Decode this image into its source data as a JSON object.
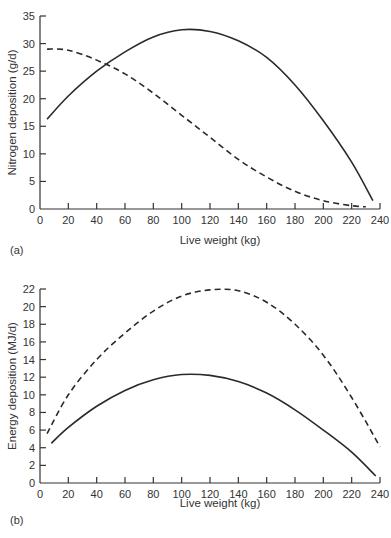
{
  "chart_data": [
    {
      "type": "line",
      "panel_label": "(a)",
      "title": "",
      "xlabel": "Live weight (kg)",
      "ylabel": "Nitrogen deposition (g/d)",
      "xlim": [
        0,
        240
      ],
      "ylim": [
        0,
        35
      ],
      "xticks": [
        0,
        20,
        40,
        60,
        80,
        100,
        120,
        140,
        160,
        180,
        200,
        220,
        240
      ],
      "yticks": [
        0,
        5,
        10,
        15,
        20,
        25,
        30,
        35
      ],
      "grid": false,
      "legend": null,
      "series": [
        {
          "name": "solid",
          "style": "solid",
          "x": [
            5,
            20,
            40,
            60,
            80,
            100,
            120,
            140,
            160,
            180,
            200,
            220,
            235
          ],
          "y": [
            16.3,
            20.5,
            25.0,
            28.5,
            31.2,
            32.5,
            32.2,
            30.5,
            27.5,
            22.5,
            16.0,
            8.5,
            1.5
          ]
        },
        {
          "name": "dashed",
          "style": "dashed",
          "x": [
            5,
            20,
            40,
            60,
            80,
            100,
            120,
            140,
            160,
            180,
            200,
            220,
            230
          ],
          "y": [
            29.0,
            28.8,
            27.0,
            24.5,
            21.0,
            17.0,
            13.0,
            9.0,
            5.8,
            3.2,
            1.5,
            0.6,
            0.4
          ]
        }
      ]
    },
    {
      "type": "line",
      "panel_label": "(b)",
      "title": "",
      "xlabel": "Live weight (kg)",
      "ylabel": "Energy deposition (MJ/d)",
      "xlim": [
        0,
        240
      ],
      "ylim": [
        0,
        22
      ],
      "xticks": [
        0,
        20,
        40,
        60,
        80,
        100,
        120,
        140,
        160,
        180,
        200,
        220,
        240
      ],
      "yticks": [
        0,
        2,
        4,
        6,
        8,
        10,
        12,
        14,
        16,
        18,
        20,
        22
      ],
      "grid": false,
      "legend": null,
      "series": [
        {
          "name": "solid",
          "style": "solid",
          "x": [
            8,
            20,
            40,
            60,
            80,
            100,
            120,
            140,
            160,
            180,
            200,
            220,
            237
          ],
          "y": [
            4.5,
            6.3,
            8.7,
            10.5,
            11.7,
            12.3,
            12.2,
            11.5,
            10.2,
            8.3,
            6.0,
            3.5,
            0.8
          ]
        },
        {
          "name": "dashed",
          "style": "dashed",
          "x": [
            5,
            20,
            40,
            60,
            80,
            100,
            120,
            140,
            160,
            180,
            200,
            220,
            240
          ],
          "y": [
            5.6,
            10.0,
            14.0,
            17.0,
            19.5,
            21.2,
            21.9,
            21.8,
            20.5,
            18.0,
            14.5,
            9.7,
            4.1
          ]
        }
      ]
    }
  ]
}
